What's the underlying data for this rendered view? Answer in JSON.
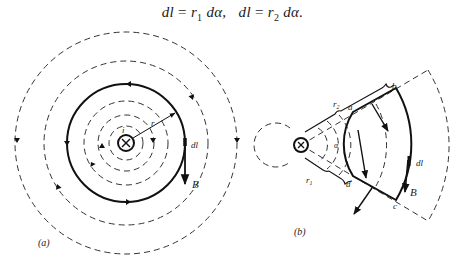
{
  "equation": {
    "lhs1": "dl",
    "eq": "=",
    "r1": "r",
    "r1_sub": "1",
    "dalpha1": "dα,",
    "lhs2": "dl",
    "r2": "r",
    "r2_sub": "2",
    "dalpha2": "dα."
  },
  "figure_a": {
    "caption": "(a)",
    "labels": {
      "current": "i",
      "radius": "r",
      "dl": "dl",
      "field": "B"
    },
    "wire_symbol": "⊗ (current into page)",
    "dashed_circle_radii_px": [
      17,
      28,
      42,
      82,
      111
    ],
    "solid_loop_radius_px": 59
  },
  "figure_b": {
    "caption": "(b)",
    "labels": {
      "r1": "r",
      "r1_sub": "1",
      "r2": "r",
      "r2_sub": "2",
      "alpha": "α",
      "a": "a",
      "b": "b",
      "c": "c",
      "d": "d",
      "dl": "dl",
      "field": "B"
    },
    "wire_symbol": "⊗ (current into page)"
  }
}
